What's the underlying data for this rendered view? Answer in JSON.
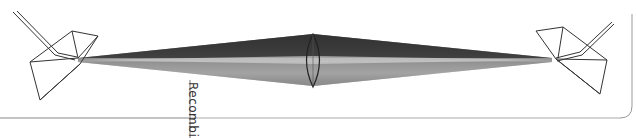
{
  "diagram": {
    "label": "Recombined",
    "colors": {
      "background": "#ffffff",
      "outline": "#333333",
      "bands": [
        "#3a3a3a",
        "#555555",
        "#6e6e6e",
        "#8a8a8a",
        "#a6a6a6",
        "#c4c4c4",
        "#9a9a9a",
        "#7a7a7a"
      ]
    },
    "elements": [
      {
        "name": "left-prism"
      },
      {
        "name": "converging-lens"
      },
      {
        "name": "right-prism"
      },
      {
        "name": "incoming-light-ray"
      },
      {
        "name": "outgoing-light-ray"
      },
      {
        "name": "dispersed-spectrum-beam"
      }
    ]
  }
}
